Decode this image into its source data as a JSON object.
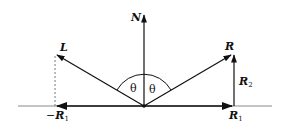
{
  "diagram": {
    "type": "reflection-vector-diagram",
    "labels": {
      "normal": "N",
      "light": "L",
      "reflection": "R",
      "neg_r1_prefix": "−",
      "neg_r1_main": "R",
      "neg_r1_sub": "1",
      "r1_main": "R",
      "r1_sub": "1",
      "r2_main": "R",
      "r2_sub": "2",
      "theta_left": "θ",
      "theta_right": "θ"
    },
    "colors": {
      "stroke": "#111111",
      "surface": "#8a8a8a",
      "dashed": "#777777",
      "background": "#ffffff"
    }
  }
}
